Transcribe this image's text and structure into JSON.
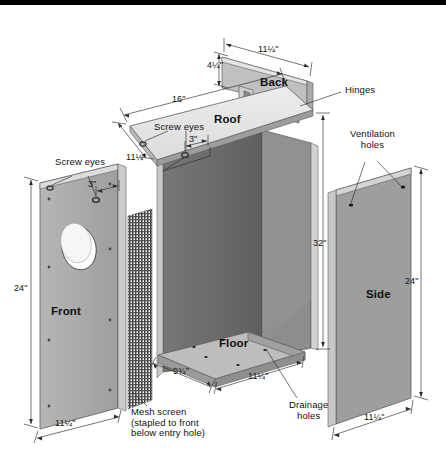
{
  "diagram": {
    "type": "exploded-assembly",
    "units": "inches",
    "colors": {
      "panel_face": "#a8a8a8",
      "panel_face_light": "#c4c4c4",
      "panel_edge": "#d8d8d8",
      "interior_dark": "#6f6f6f",
      "interior_darker": "#5c5c5c",
      "roof_top": "#e2e2e2",
      "line": "#2b2b2b",
      "text": "#111111",
      "topbar": "#000000",
      "background": "#ffffff"
    }
  },
  "parts": {
    "back": "Back",
    "roof": "Roof",
    "front": "Front",
    "side": "Side",
    "floor": "Floor"
  },
  "callouts": {
    "hinges": "Hinges",
    "ventilation_holes": "Ventilation\nholes",
    "drainage_holes": "Drainage\nholes",
    "screw_eyes_roof": "Screw eyes",
    "screw_eyes_front": "Screw eyes",
    "mesh_screen": "Mesh screen\n(stapled to front\nbelow entry hole)"
  },
  "dimensions": {
    "back_height": "4¼\"",
    "back_width": "11¼\"",
    "roof_length": "16\"",
    "roof_depth": "11¼\"",
    "roof_screw_spacing": "3\"",
    "front_screw_spacing": "3\"",
    "front_height": "24\"",
    "front_width": "11¼\"",
    "box_height": "32\"",
    "side_height": "24\"",
    "side_width": "11¼\"",
    "floor_depth": "9¾\"",
    "floor_width": "11¼\""
  }
}
